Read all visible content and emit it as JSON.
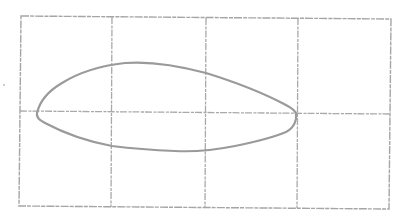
{
  "diagram": {
    "type": "grid-with-closed-curve",
    "colors": {
      "background": "#ffffff",
      "grid": "#a9a9a9",
      "curve": "#9a9a9a"
    },
    "frame": {
      "corners": {
        "top_left": [
          21,
          16
        ],
        "top_right": [
          391,
          19
        ],
        "bottom_right": [
          389,
          209
        ],
        "bottom_left": [
          19,
          206
        ]
      }
    },
    "grid": {
      "columns": 4,
      "rows": 2,
      "vertical_lines_x": [
        112,
        206,
        298
      ],
      "horizontal_midline_y": 111
    },
    "curve": {
      "shape": "closed teardrop / airfoil-like loop",
      "left_tip": [
        37,
        113
      ],
      "right_tip": [
        296,
        114
      ],
      "top_peak": [
        135,
        63
      ],
      "bottom_low": [
        185,
        152
      ],
      "path": "M37,113 C40,100 50,90 62,83 C78,73 98,66 125,63 C150,61 180,66 206,73 C235,82 265,94 284,104 C292,108 296,111 296,114 C297,120 294,128 286,132 C272,138 255,142 235,146 C215,150 195,152 175,151 C150,150 128,148 112,146 C85,141 60,131 45,123 C39,120 36,117 37,113 Z"
    },
    "marks": [
      {
        "type": "speck",
        "position": [
          4,
          85
        ]
      }
    ],
    "text": []
  }
}
